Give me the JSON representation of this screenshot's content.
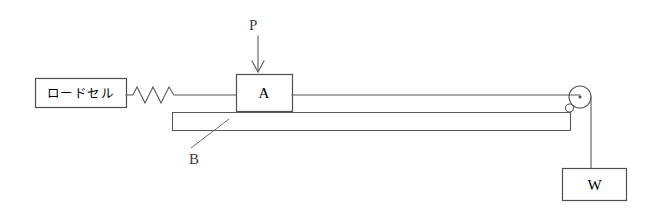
{
  "figure": {
    "background_color": "#ffffff",
    "line_color": "#595959",
    "text_color": "#3d3d3d",
    "width": 651,
    "height": 211
  },
  "components": {
    "load_cell": {
      "label": "ロードセル",
      "name": "load-cell",
      "box": {
        "x": 35,
        "y": 78,
        "w": 91,
        "h": 29
      }
    },
    "spring": {
      "name": "spring",
      "peaks": 4,
      "x_start": 126,
      "x_end": 178,
      "y": 95
    },
    "block_a": {
      "label": "A",
      "name": "block-a",
      "box": {
        "x": 236,
        "y": 74,
        "w": 56,
        "h": 37
      }
    },
    "load_p": {
      "label": "P",
      "name": "applied-load-p",
      "arrow": {
        "x": 258,
        "y_start": 36,
        "y_end": 72
      }
    },
    "bar_b": {
      "label": "B",
      "name": "bar-b",
      "box": {
        "x": 172,
        "y": 112,
        "w": 398,
        "h": 19
      },
      "leader_from": {
        "x": 188,
        "y": 150
      },
      "leader_to": {
        "x": 229,
        "y": 119
      }
    },
    "pulley": {
      "name": "pulley",
      "center": {
        "x": 580,
        "y": 97
      },
      "radius": 11,
      "axle_dot_radius": 1.6,
      "guide_ring": {
        "x": 569,
        "y": 108,
        "r": 4
      }
    },
    "cord": {
      "name": "cord",
      "top_run_y": 95,
      "from_x": 292,
      "to_x": 580,
      "vertical_x": 591,
      "vertical_from_y": 97,
      "vertical_to_y": 169
    },
    "weight_w": {
      "label": "W",
      "name": "hanging-weight-w",
      "box": {
        "x": 562,
        "y": 168,
        "w": 64,
        "h": 33
      }
    }
  },
  "labels": {
    "load_cell": "ロードセル",
    "block_a": "A",
    "load_p": "P",
    "bar_b": "B",
    "weight_w": "W"
  }
}
